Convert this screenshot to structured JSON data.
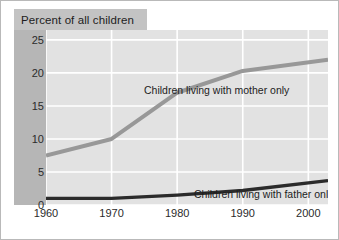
{
  "figure": {
    "title": "Percent of all children",
    "background_color": "#e2e2e2",
    "gridline_color": "#ffffff",
    "title_band_color": "#c3c3c3",
    "axis_band_color": "#b6b6b6",
    "border_color": "#b9b9b9"
  },
  "chart_data": {
    "type": "line",
    "title": "Percent of all children",
    "xlabel": "",
    "ylabel": "Percent of all children",
    "xlim": [
      1960,
      2003
    ],
    "ylim": [
      0,
      26.5
    ],
    "xticks": [
      1960,
      1970,
      1980,
      1990,
      2000
    ],
    "yticks": [
      0,
      5,
      10,
      15,
      20,
      25
    ],
    "xtick_labels": [
      "1960",
      "1970",
      "1980",
      "1990",
      "2000"
    ],
    "ytick_labels": [
      "0",
      "5",
      "10",
      "15",
      "20",
      "25"
    ],
    "grid": true,
    "grid_axis": "both",
    "legend": "inline-annotations",
    "x": [
      1960,
      1970,
      1980,
      1990,
      2003
    ],
    "series": [
      {
        "name": "Children living with mother only",
        "color": "#989898",
        "width": 4,
        "values": [
          7.5,
          10.0,
          17.0,
          20.3,
          22.0
        ]
      },
      {
        "name": "Children living with father only",
        "color": "#2b2b2b",
        "width": 3.4,
        "values": [
          1.0,
          1.0,
          1.5,
          2.2,
          3.7
        ]
      }
    ],
    "annotations": [
      {
        "text": "Children living with mother only",
        "x": 1980,
        "y": 23.5
      },
      {
        "text": "Children living with father only",
        "x": 1988,
        "y": 6.2
      }
    ]
  }
}
